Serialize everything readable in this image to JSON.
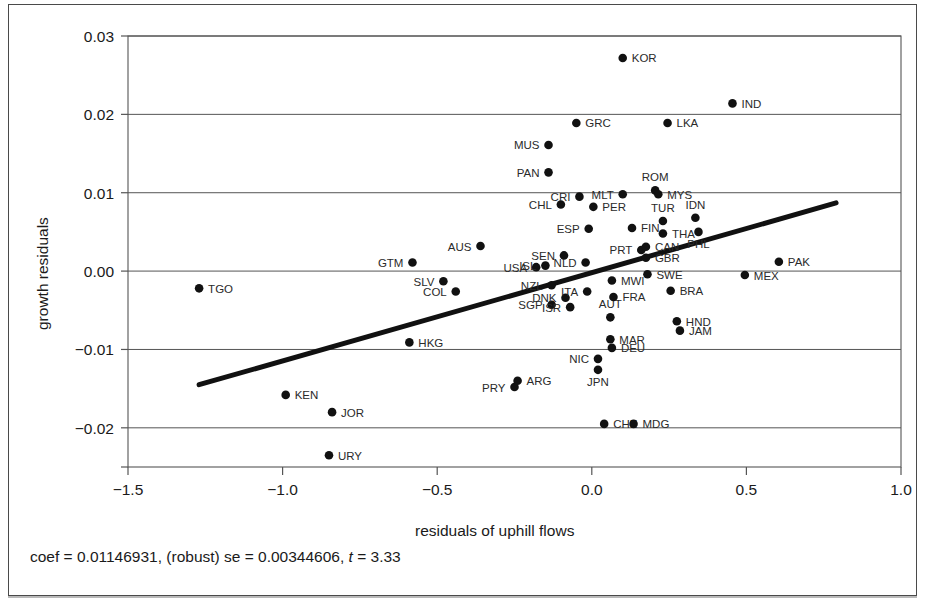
{
  "figure": {
    "xlabel": "residuals of uphill flows",
    "ylabel": "growth residuals",
    "caption_prefix": "coef = 0.01146931, (robust) se = 0.00344606, ",
    "caption_t_symbol": "t",
    "caption_suffix": " = 3.33"
  },
  "chart_data": {
    "type": "scatter",
    "title": "",
    "xlabel": "residuals of uphill flows",
    "ylabel": "growth residuals",
    "xlim": [
      -1.5,
      1.0
    ],
    "ylim": [
      -0.025,
      0.03
    ],
    "xticks": [
      -1.5,
      -1.0,
      -0.5,
      0.0,
      0.5,
      1.0
    ],
    "xticklabels": [
      "−1.5",
      "−1.0",
      "−0.5",
      "0.0",
      "0.5",
      "1.0"
    ],
    "yticks": [
      -0.02,
      -0.01,
      0.0,
      0.01,
      0.02,
      0.03
    ],
    "yticklabels": [
      "−0.02",
      "−0.01",
      "0.00",
      "0.01",
      "0.02",
      "0.03"
    ],
    "grid": "horizontal",
    "legend": "none",
    "annotations": {
      "coef": 0.01146931,
      "robust_se": 0.00344606,
      "t": 3.33
    },
    "fit_line": {
      "type": "linear",
      "slope": 0.01146931,
      "x_start": -1.27,
      "y_start": -0.0145,
      "x_end": 0.79,
      "y_end": 0.0087
    },
    "points": [
      {
        "label": "TGO",
        "x": -1.27,
        "y": -0.0022,
        "label_side": "right"
      },
      {
        "label": "KEN",
        "x": -0.99,
        "y": -0.0158,
        "label_side": "right"
      },
      {
        "label": "JOR",
        "x": -0.84,
        "y": -0.018,
        "label_side": "right"
      },
      {
        "label": "URY",
        "x": -0.85,
        "y": -0.0235,
        "label_side": "right"
      },
      {
        "label": "HKG",
        "x": -0.59,
        "y": -0.0091,
        "label_side": "right"
      },
      {
        "label": "GTM",
        "x": -0.58,
        "y": 0.0011,
        "label_side": "left"
      },
      {
        "label": "SLV",
        "x": -0.48,
        "y": -0.0013,
        "label_side": "left"
      },
      {
        "label": "COL",
        "x": -0.44,
        "y": -0.0026,
        "label_side": "left"
      },
      {
        "label": "AUS",
        "x": -0.36,
        "y": 0.0032,
        "label_side": "left"
      },
      {
        "label": "PRY",
        "x": -0.25,
        "y": -0.0148,
        "label_side": "left"
      },
      {
        "label": "ARG",
        "x": -0.24,
        "y": -0.014,
        "label_side": "right"
      },
      {
        "label": "USA",
        "x": -0.18,
        "y": 0.0005,
        "label_side": "left"
      },
      {
        "label": "ISL",
        "x": -0.15,
        "y": 0.0007,
        "label_side": "left"
      },
      {
        "label": "MUS",
        "x": -0.14,
        "y": 0.0161,
        "label_side": "left"
      },
      {
        "label": "PAN",
        "x": -0.14,
        "y": 0.0126,
        "label_side": "left"
      },
      {
        "label": "NZL",
        "x": -0.13,
        "y": -0.0018,
        "label_side": "left"
      },
      {
        "label": "SGP",
        "x": -0.13,
        "y": -0.0043,
        "label_side": "left"
      },
      {
        "label": "CHL",
        "x": -0.1,
        "y": 0.0085,
        "label_side": "left"
      },
      {
        "label": "SEN",
        "x": -0.09,
        "y": 0.002,
        "label_side": "left"
      },
      {
        "label": "DNK",
        "x": -0.085,
        "y": -0.0034,
        "label_side": "left"
      },
      {
        "label": "ISR",
        "x": -0.07,
        "y": -0.0046,
        "label_side": "left"
      },
      {
        "label": "GRC",
        "x": -0.05,
        "y": 0.0189,
        "label_side": "right"
      },
      {
        "label": "CRI",
        "x": -0.04,
        "y": 0.0095,
        "label_side": "left"
      },
      {
        "label": "NLD",
        "x": -0.02,
        "y": 0.0011,
        "label_side": "left"
      },
      {
        "label": "ITA",
        "x": -0.015,
        "y": -0.0026,
        "label_side": "left"
      },
      {
        "label": "ESP",
        "x": -0.01,
        "y": 0.0054,
        "label_side": "left"
      },
      {
        "label": "PER",
        "x": 0.005,
        "y": 0.0082,
        "label_side": "right"
      },
      {
        "label": "NIC",
        "x": 0.02,
        "y": -0.0112,
        "label_side": "left"
      },
      {
        "label": "JPN",
        "x": 0.02,
        "y": -0.0126,
        "label_side": "below"
      },
      {
        "label": "CHE",
        "x": 0.04,
        "y": -0.0195,
        "label_side": "right"
      },
      {
        "label": "AUT",
        "x": 0.06,
        "y": -0.0059,
        "label_side": "above"
      },
      {
        "label": "MAR",
        "x": 0.06,
        "y": -0.0087,
        "label_side": "right"
      },
      {
        "label": "DEU",
        "x": 0.065,
        "y": -0.0098,
        "label_side": "right"
      },
      {
        "label": "MWI",
        "x": 0.065,
        "y": -0.0012,
        "label_side": "right"
      },
      {
        "label": "FRA",
        "x": 0.07,
        "y": -0.0033,
        "label_side": "right"
      },
      {
        "label": "MLT",
        "x": 0.1,
        "y": 0.0098,
        "label_side": "left"
      },
      {
        "label": "FIN",
        "x": 0.13,
        "y": 0.0055,
        "label_side": "right"
      },
      {
        "label": "MDG",
        "x": 0.135,
        "y": -0.0195,
        "label_side": "right"
      },
      {
        "label": "PRT",
        "x": 0.16,
        "y": 0.0027,
        "label_side": "left"
      },
      {
        "label": "CAN",
        "x": 0.175,
        "y": 0.0031,
        "label_side": "right"
      },
      {
        "label": "GBR",
        "x": 0.175,
        "y": 0.0017,
        "label_side": "right"
      },
      {
        "label": "SWE",
        "x": 0.18,
        "y": -0.0004,
        "label_side": "right"
      },
      {
        "label": "ROM",
        "x": 0.205,
        "y": 0.0103,
        "label_side": "above"
      },
      {
        "label": "MYS",
        "x": 0.215,
        "y": 0.0098,
        "label_side": "right"
      },
      {
        "label": "TUR",
        "x": 0.23,
        "y": 0.0064,
        "label_side": "above"
      },
      {
        "label": "THA",
        "x": 0.23,
        "y": 0.0048,
        "label_side": "right"
      },
      {
        "label": "LKA",
        "x": 0.245,
        "y": 0.0189,
        "label_side": "right"
      },
      {
        "label": "BRA",
        "x": 0.255,
        "y": -0.0025,
        "label_side": "right"
      },
      {
        "label": "HND",
        "x": 0.275,
        "y": -0.0064,
        "label_side": "right"
      },
      {
        "label": "JAM",
        "x": 0.285,
        "y": -0.0076,
        "label_side": "right"
      },
      {
        "label": "IDN",
        "x": 0.335,
        "y": 0.0068,
        "label_side": "above"
      },
      {
        "label": "PHL",
        "x": 0.345,
        "y": 0.005,
        "label_side": "below"
      },
      {
        "label": "KOR",
        "x": 0.1,
        "y": 0.0272,
        "label_side": "right"
      },
      {
        "label": "IND",
        "x": 0.455,
        "y": 0.0214,
        "label_side": "right"
      },
      {
        "label": "MEX",
        "x": 0.495,
        "y": -0.0005,
        "label_side": "right"
      },
      {
        "label": "PAK",
        "x": 0.605,
        "y": 0.0012,
        "label_side": "right"
      }
    ]
  }
}
